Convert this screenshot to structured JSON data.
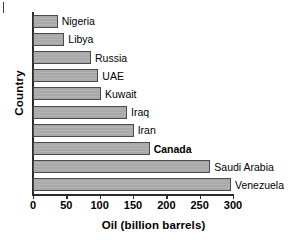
{
  "chart_data": {
    "type": "bar",
    "orientation": "horizontal",
    "title": "",
    "xlabel": "Oil (billion barrels)",
    "ylabel": "Country",
    "categories": [
      "Nigeria",
      "Libya",
      "Russia",
      "UAE",
      "Kuwait",
      "Iraq",
      "Iran",
      "Canada",
      "Saudi Arabia",
      "Venezuela"
    ],
    "values": [
      37,
      47,
      87,
      98,
      102,
      141,
      151,
      175,
      266,
      297
    ],
    "xlim": [
      0,
      300
    ],
    "xticks": [
      0,
      50,
      100,
      150,
      200,
      250,
      300
    ],
    "xticklabels": [
      "0",
      "50",
      "100",
      "150",
      "200",
      "250",
      "300"
    ],
    "grid": false,
    "legend": null,
    "emphasis": [
      "Canada"
    ],
    "bar_color": "#a9a9a9",
    "bar_edge_color": "#4a4a4a",
    "axis_color": "#2b2b2b"
  }
}
